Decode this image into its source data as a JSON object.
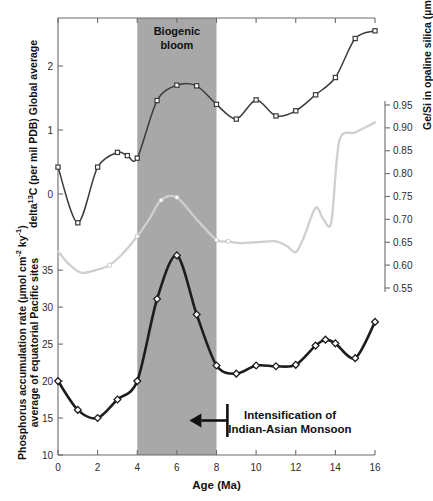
{
  "chart_data": {
    "type": "line",
    "title": "",
    "xlabel": "Age (Ma)",
    "xlim": [
      0,
      16
    ],
    "xticks": [
      0,
      2,
      4,
      6,
      8,
      10,
      12,
      14,
      16
    ],
    "grid": false,
    "legend_position": "none",
    "annotations": [
      {
        "name": "biogenic-bloom",
        "text_line1": "Biogenic",
        "text_line2": "bloom",
        "x_range": [
          4,
          8
        ]
      },
      {
        "name": "monsoon",
        "text_line1": "Intensification of",
        "text_line2": "Indian-Asian Monsoon",
        "arrow": "left",
        "arrow_from_x": 8.6,
        "arrow_to_x": 7.6
      }
    ],
    "shaded_band": {
      "label": "Biogenic bloom",
      "x_start": 4,
      "x_end": 8,
      "color": "#a8a8a8"
    },
    "panels": [
      {
        "name": "delta13c-panel",
        "ylabel": "delta13C (per mil PDB) Global average",
        "ylabel_prefix": "delta",
        "ylabel_sup": "13",
        "ylabel_rest": "C (per mil PDB) Global average",
        "ylim": [
          -0.75,
          2.75
        ],
        "yticks": [
          0,
          1,
          2
        ],
        "ytick_labels": [
          "0",
          "1",
          "2"
        ],
        "axis_side": "left",
        "series": [
          {
            "name": "delta13C",
            "marker": "square-open",
            "color": "#3b3b3b",
            "x": [
              0,
              1,
              2,
              3,
              3.5,
              4,
              5,
              6,
              7,
              8,
              9,
              10,
              11,
              12,
              13,
              14,
              15,
              16
            ],
            "values": [
              0.42,
              -0.45,
              0.42,
              0.65,
              0.6,
              0.56,
              1.46,
              1.7,
              1.69,
              1.4,
              1.17,
              1.47,
              1.22,
              1.3,
              1.55,
              1.82,
              2.43,
              2.55
            ]
          }
        ]
      },
      {
        "name": "gesi-panel",
        "ylabel": "Ge/Si in opaline silica (umol/mol)",
        "ylabel_text": "Ge/Si in opaline silica (µmol/mol)",
        "ylim": [
          0.53,
          0.97
        ],
        "yticks": [
          0.55,
          0.6,
          0.65,
          0.7,
          0.75,
          0.8,
          0.85,
          0.9,
          0.95
        ],
        "ytick_labels": [
          "0.55",
          "0.60",
          "0.65",
          "0.70",
          "0.75",
          "0.80",
          "0.85",
          "0.90",
          "0.95"
        ],
        "axis_side": "right",
        "series": [
          {
            "name": "Ge/Si",
            "marker": "circle-filled-small",
            "color": "#cfcfcf",
            "x": [
              0,
              0.6,
              1.2,
              2.0,
              2.6,
              3.2,
              4.0,
              4.6,
              5.2,
              6.0,
              7.0,
              8.0,
              8.6,
              9.2,
              10.0,
              11.0,
              11.6,
              12.0,
              12.4,
              13.0,
              13.4,
              13.8,
              14.2,
              15.0,
              16.0
            ],
            "values": [
              0.63,
              0.6,
              0.583,
              0.59,
              0.6,
              0.622,
              0.663,
              0.7,
              0.742,
              0.748,
              0.7,
              0.655,
              0.652,
              0.648,
              0.65,
              0.652,
              0.64,
              0.628,
              0.66,
              0.725,
              0.7,
              0.695,
              0.872,
              0.89,
              0.912
            ]
          }
        ]
      },
      {
        "name": "phosphorus-panel",
        "ylabel": "Phosphorus accumulation rate (umol cm-2 ky-1) average of equatorial Pacific sites",
        "ylabel_line1": "Phosphorus accumulation rate (µmol cm",
        "ylabel_line1_sup1": "-2",
        "ylabel_line1_mid": " ky",
        "ylabel_line1_sup2": "-1",
        "ylabel_line1_end": ")",
        "ylabel_line2": "average of equatorial Pacific sites",
        "ylim": [
          10,
          38
        ],
        "yticks": [
          10,
          15,
          20,
          25,
          30,
          35
        ],
        "ytick_labels": [
          "10",
          "15",
          "20",
          "25",
          "30",
          "35"
        ],
        "axis_side": "left",
        "series": [
          {
            "name": "Phosphorus accumulation rate",
            "marker": "diamond-open",
            "color": "#1d1d1d",
            "x": [
              0,
              1,
              2,
              3,
              4,
              5,
              6,
              7,
              8,
              9,
              10,
              11,
              12,
              13,
              13.5,
              14,
              15,
              16
            ],
            "values": [
              20.0,
              16.1,
              15.0,
              17.5,
              20.0,
              31.1,
              37.0,
              29.0,
              22.1,
              21.0,
              22.1,
              22.0,
              22.2,
              24.8,
              25.6,
              25.1,
              23.1,
              28.0
            ]
          }
        ]
      }
    ]
  },
  "axes": {
    "x_title": "Age (Ma)",
    "x_tick_labels": [
      "0",
      "2",
      "4",
      "6",
      "8",
      "10",
      "12",
      "14",
      "16"
    ]
  },
  "labels": {
    "biogenic_line1": "Biogenic",
    "biogenic_line2": "bloom",
    "monsoon_line1": "Intensification of",
    "monsoon_line2": "Indian-Asian Monsoon",
    "delta13c_prefix": "delta",
    "delta13c_sup": "13",
    "delta13c_rest": "C (per mil PDB) Global average",
    "gesi_title": "Ge/Si in opaline silica (µmol/mol)",
    "phos_line1_a": "Phosphorus accumulation rate (µmol cm",
    "phos_line1_sup1": "-2",
    "phos_line1_b": " ky",
    "phos_line1_sup2": "-1",
    "phos_line1_c": ")",
    "phos_line2": "average of equatorial Pacific sites"
  },
  "colors": {
    "band": "#a8a8a8",
    "delta13c_line": "#3b3b3b",
    "gesi_line": "#cfcfcf",
    "phosphorus_line": "#1d1d1d",
    "axis": "#6b6b6b",
    "text": "#111111",
    "background": "#ffffff"
  }
}
